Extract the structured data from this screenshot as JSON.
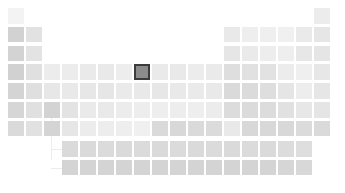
{
  "figure": {
    "title": "",
    "background": "#ffffff",
    "selected_color": "#8c8c8c",
    "selected_border": "#3c3c3c",
    "empty_color": "#ffffff"
  },
  "layout": {
    "cell_size": 15.5,
    "cell_pitch_x": 18.0,
    "cell_pitch_y": 18.8,
    "origin_x": 8,
    "origin_y": 8,
    "fblock_origin_x": 62,
    "fblock_origin_y": 141,
    "columns": 18,
    "main_rows": 7,
    "fblock_rows": 2,
    "fblock_columns": 14
  },
  "chart_data": {
    "type": "heatmap",
    "title": "",
    "xlabel": "",
    "ylabel": "",
    "grid": false,
    "legend": "none",
    "colorscale": "grayscale",
    "value_range": [
      0,
      1
    ],
    "selected": {
      "symbol": "Fe",
      "name": "Iron",
      "atomic_number": 26,
      "group": 8,
      "period": 4,
      "value": 0.48
    },
    "cells": [
      {
        "symbol": "H",
        "z": 1,
        "group": 1,
        "period": 1,
        "value": 0.06,
        "color": "#f3f3f3"
      },
      {
        "symbol": "He",
        "z": 2,
        "group": 18,
        "period": 1,
        "value": 0.13,
        "color": "#ececec"
      },
      {
        "symbol": "Li",
        "z": 3,
        "group": 1,
        "period": 2,
        "value": 0.32,
        "color": "#d2d2d2"
      },
      {
        "symbol": "Be",
        "z": 4,
        "group": 2,
        "period": 2,
        "value": 0.2,
        "color": "#e2e2e2"
      },
      {
        "symbol": "B",
        "z": 5,
        "group": 13,
        "period": 2,
        "value": 0.15,
        "color": "#e9e9e9"
      },
      {
        "symbol": "C",
        "z": 6,
        "group": 14,
        "period": 2,
        "value": 0.11,
        "color": "#eeeeee"
      },
      {
        "symbol": "N",
        "z": 7,
        "group": 15,
        "period": 2,
        "value": 0.1,
        "color": "#efefef"
      },
      {
        "symbol": "O",
        "z": 8,
        "group": 16,
        "period": 2,
        "value": 0.09,
        "color": "#f0f0f0"
      },
      {
        "symbol": "F",
        "z": 9,
        "group": 17,
        "period": 2,
        "value": 0.14,
        "color": "#eaeaea"
      },
      {
        "symbol": "Ne",
        "z": 10,
        "group": 18,
        "period": 2,
        "value": 0.17,
        "color": "#e6e6e6"
      },
      {
        "symbol": "Na",
        "z": 11,
        "group": 1,
        "period": 3,
        "value": 0.31,
        "color": "#d3d3d3"
      },
      {
        "symbol": "Mg",
        "z": 12,
        "group": 2,
        "period": 3,
        "value": 0.19,
        "color": "#e3e3e3"
      },
      {
        "symbol": "Al",
        "z": 13,
        "group": 13,
        "period": 3,
        "value": 0.17,
        "color": "#e6e6e6"
      },
      {
        "symbol": "Si",
        "z": 14,
        "group": 14,
        "period": 3,
        "value": 0.14,
        "color": "#eaeaea"
      },
      {
        "symbol": "P",
        "z": 15,
        "group": 15,
        "period": 3,
        "value": 0.12,
        "color": "#ededed"
      },
      {
        "symbol": "S",
        "z": 16,
        "group": 16,
        "period": 3,
        "value": 0.11,
        "color": "#eeeeee"
      },
      {
        "symbol": "Cl",
        "z": 17,
        "group": 17,
        "period": 3,
        "value": 0.16,
        "color": "#e7e7e7"
      },
      {
        "symbol": "Ar",
        "z": 18,
        "group": 18,
        "period": 3,
        "value": 0.18,
        "color": "#e5e5e5"
      },
      {
        "symbol": "K",
        "z": 19,
        "group": 1,
        "period": 4,
        "value": 0.33,
        "color": "#d1d1d1"
      },
      {
        "symbol": "Ca",
        "z": 20,
        "group": 2,
        "period": 4,
        "value": 0.22,
        "color": "#e0e0e0"
      },
      {
        "symbol": "Sc",
        "z": 21,
        "group": 3,
        "period": 4,
        "value": 0.13,
        "color": "#ececec"
      },
      {
        "symbol": "Ti",
        "z": 22,
        "group": 4,
        "period": 4,
        "value": 0.13,
        "color": "#ececec"
      },
      {
        "symbol": "V",
        "z": 23,
        "group": 5,
        "period": 4,
        "value": 0.14,
        "color": "#eaeaea"
      },
      {
        "symbol": "Cr",
        "z": 24,
        "group": 6,
        "period": 4,
        "value": 0.15,
        "color": "#e9e9e9"
      },
      {
        "symbol": "Mn",
        "z": 25,
        "group": 7,
        "period": 4,
        "value": 0.12,
        "color": "#ededed"
      },
      {
        "symbol": "Fe",
        "z": 26,
        "group": 8,
        "period": 4,
        "value": 0.48,
        "color": "#8c8c8c"
      },
      {
        "symbol": "Co",
        "z": 27,
        "group": 9,
        "period": 4,
        "value": 0.14,
        "color": "#eaeaea"
      },
      {
        "symbol": "Ni",
        "z": 28,
        "group": 10,
        "period": 4,
        "value": 0.15,
        "color": "#e9e9e9"
      },
      {
        "symbol": "Cu",
        "z": 29,
        "group": 11,
        "period": 4,
        "value": 0.13,
        "color": "#ececec"
      },
      {
        "symbol": "Zn",
        "z": 30,
        "group": 12,
        "period": 4,
        "value": 0.14,
        "color": "#eaeaea"
      },
      {
        "symbol": "Ga",
        "z": 31,
        "group": 13,
        "period": 4,
        "value": 0.24,
        "color": "#dedede"
      },
      {
        "symbol": "Ge",
        "z": 32,
        "group": 14,
        "period": 4,
        "value": 0.21,
        "color": "#e1e1e1"
      },
      {
        "symbol": "As",
        "z": 33,
        "group": 15,
        "period": 4,
        "value": 0.2,
        "color": "#e2e2e2"
      },
      {
        "symbol": "Se",
        "z": 34,
        "group": 16,
        "period": 4,
        "value": 0.13,
        "color": "#ececec"
      },
      {
        "symbol": "Br",
        "z": 35,
        "group": 17,
        "period": 4,
        "value": 0.1,
        "color": "#efefef"
      },
      {
        "symbol": "Kr",
        "z": 36,
        "group": 18,
        "period": 4,
        "value": 0.16,
        "color": "#e7e7e7"
      },
      {
        "symbol": "Rb",
        "z": 37,
        "group": 1,
        "period": 5,
        "value": 0.3,
        "color": "#d4d4d4"
      },
      {
        "symbol": "Sr",
        "z": 38,
        "group": 2,
        "period": 5,
        "value": 0.23,
        "color": "#dfdfdf"
      },
      {
        "symbol": "Y",
        "z": 39,
        "group": 3,
        "period": 5,
        "value": 0.16,
        "color": "#e7e7e7"
      },
      {
        "symbol": "Zr",
        "z": 40,
        "group": 4,
        "period": 5,
        "value": 0.15,
        "color": "#e9e9e9"
      },
      {
        "symbol": "Nb",
        "z": 41,
        "group": 5,
        "period": 5,
        "value": 0.16,
        "color": "#e7e7e7"
      },
      {
        "symbol": "Mo",
        "z": 42,
        "group": 6,
        "period": 5,
        "value": 0.17,
        "color": "#e6e6e6"
      },
      {
        "symbol": "Tc",
        "z": 43,
        "group": 7,
        "period": 5,
        "value": 0.14,
        "color": "#eaeaea"
      },
      {
        "symbol": "Ru",
        "z": 44,
        "group": 8,
        "period": 5,
        "value": 0.15,
        "color": "#e9e9e9"
      },
      {
        "symbol": "Rh",
        "z": 45,
        "group": 9,
        "period": 5,
        "value": 0.16,
        "color": "#e7e7e7"
      },
      {
        "symbol": "Pd",
        "z": 46,
        "group": 10,
        "period": 5,
        "value": 0.15,
        "color": "#e9e9e9"
      },
      {
        "symbol": "Ag",
        "z": 47,
        "group": 11,
        "period": 5,
        "value": 0.14,
        "color": "#eaeaea"
      },
      {
        "symbol": "Cd",
        "z": 48,
        "group": 12,
        "period": 5,
        "value": 0.15,
        "color": "#e9e9e9"
      },
      {
        "symbol": "In",
        "z": 49,
        "group": 13,
        "period": 5,
        "value": 0.27,
        "color": "#dadada"
      },
      {
        "symbol": "Sn",
        "z": 50,
        "group": 14,
        "period": 5,
        "value": 0.26,
        "color": "#dbdbdb"
      },
      {
        "symbol": "Sb",
        "z": 51,
        "group": 15,
        "period": 5,
        "value": 0.24,
        "color": "#dedede"
      },
      {
        "symbol": "Te",
        "z": 52,
        "group": 16,
        "period": 5,
        "value": 0.18,
        "color": "#e5e5e5"
      },
      {
        "symbol": "I",
        "z": 53,
        "group": 17,
        "period": 5,
        "value": 0.12,
        "color": "#ededed"
      },
      {
        "symbol": "Xe",
        "z": 54,
        "group": 18,
        "period": 5,
        "value": 0.17,
        "color": "#e6e6e6"
      },
      {
        "symbol": "Cs",
        "z": 55,
        "group": 1,
        "period": 6,
        "value": 0.29,
        "color": "#d6d6d6"
      },
      {
        "symbol": "Ba",
        "z": 56,
        "group": 2,
        "period": 6,
        "value": 0.22,
        "color": "#e0e0e0"
      },
      {
        "symbol": "La",
        "z": 57,
        "group": 3,
        "period": 6,
        "value": 0.31,
        "color": "#d3d3d3"
      },
      {
        "symbol": "Hf",
        "z": 72,
        "group": 4,
        "period": 6,
        "value": 0.19,
        "color": "#e3e3e3"
      },
      {
        "symbol": "Ta",
        "z": 73,
        "group": 5,
        "period": 6,
        "value": 0.14,
        "color": "#eaeaea"
      },
      {
        "symbol": "W",
        "z": 74,
        "group": 6,
        "period": 6,
        "value": 0.15,
        "color": "#e9e9e9"
      },
      {
        "symbol": "Re",
        "z": 75,
        "group": 7,
        "period": 6,
        "value": 0.13,
        "color": "#ececec"
      },
      {
        "symbol": "Os",
        "z": 76,
        "group": 8,
        "period": 6,
        "value": 0.12,
        "color": "#ededed"
      },
      {
        "symbol": "Ir",
        "z": 77,
        "group": 9,
        "period": 6,
        "value": 0.11,
        "color": "#eeeeee"
      },
      {
        "symbol": "Pt",
        "z": 78,
        "group": 10,
        "period": 6,
        "value": 0.12,
        "color": "#ededed"
      },
      {
        "symbol": "Au",
        "z": 79,
        "group": 11,
        "period": 6,
        "value": 0.11,
        "color": "#eeeeee"
      },
      {
        "symbol": "Hg",
        "z": 80,
        "group": 12,
        "period": 6,
        "value": 0.13,
        "color": "#ececec"
      },
      {
        "symbol": "Tl",
        "z": 81,
        "group": 13,
        "period": 6,
        "value": 0.25,
        "color": "#dcdcdc"
      },
      {
        "symbol": "Pb",
        "z": 82,
        "group": 14,
        "period": 6,
        "value": 0.26,
        "color": "#dbdbdb"
      },
      {
        "symbol": "Bi",
        "z": 83,
        "group": 15,
        "period": 6,
        "value": 0.25,
        "color": "#dcdcdc"
      },
      {
        "symbol": "Po",
        "z": 84,
        "group": 16,
        "period": 6,
        "value": 0.21,
        "color": "#e1e1e1"
      },
      {
        "symbol": "At",
        "z": 85,
        "group": 17,
        "period": 6,
        "value": 0.16,
        "color": "#e7e7e7"
      },
      {
        "symbol": "Rn",
        "z": 86,
        "group": 18,
        "period": 6,
        "value": 0.18,
        "color": "#e5e5e5"
      },
      {
        "symbol": "Fr",
        "z": 87,
        "group": 1,
        "period": 7,
        "value": 0.27,
        "color": "#dadada"
      },
      {
        "symbol": "Ra",
        "z": 88,
        "group": 2,
        "period": 7,
        "value": 0.21,
        "color": "#e1e1e1"
      },
      {
        "symbol": "Ac",
        "z": 89,
        "group": 3,
        "period": 7,
        "value": 0.3,
        "color": "#d4d4d4"
      },
      {
        "symbol": "Rf",
        "z": 104,
        "group": 4,
        "period": 7,
        "value": 0.17,
        "color": "#e6e6e6"
      },
      {
        "symbol": "Db",
        "z": 105,
        "group": 5,
        "period": 7,
        "value": 0.13,
        "color": "#ececec"
      },
      {
        "symbol": "Sg",
        "z": 106,
        "group": 6,
        "period": 7,
        "value": 0.12,
        "color": "#ededed"
      },
      {
        "symbol": "Bh",
        "z": 107,
        "group": 7,
        "period": 7,
        "value": 0.11,
        "color": "#eeeeee"
      },
      {
        "symbol": "Hs",
        "z": 108,
        "group": 8,
        "period": 7,
        "value": 0.09,
        "color": "#f0f0f0"
      },
      {
        "symbol": "Mt",
        "z": 109,
        "group": 9,
        "period": 7,
        "value": 0.27,
        "color": "#dadada"
      },
      {
        "symbol": "Ds",
        "z": 110,
        "group": 10,
        "period": 7,
        "value": 0.28,
        "color": "#d8d8d8"
      },
      {
        "symbol": "Rg",
        "z": 111,
        "group": 11,
        "period": 7,
        "value": 0.27,
        "color": "#dadada"
      },
      {
        "symbol": "Cn",
        "z": 112,
        "group": 12,
        "period": 7,
        "value": 0.26,
        "color": "#dbdbdb"
      },
      {
        "symbol": "Nh",
        "z": 113,
        "group": 13,
        "period": 7,
        "value": 0.15,
        "color": "#e9e9e9"
      },
      {
        "symbol": "Fl",
        "z": 114,
        "group": 14,
        "period": 7,
        "value": 0.28,
        "color": "#d8d8d8"
      },
      {
        "symbol": "Mc",
        "z": 115,
        "group": 15,
        "period": 7,
        "value": 0.28,
        "color": "#d8d8d8"
      },
      {
        "symbol": "Lv",
        "z": 116,
        "group": 16,
        "period": 7,
        "value": 0.28,
        "color": "#d8d8d8"
      },
      {
        "symbol": "Ts",
        "z": 117,
        "group": 17,
        "period": 7,
        "value": 0.26,
        "color": "#dbdbdb"
      },
      {
        "symbol": "Og",
        "z": 118,
        "group": 18,
        "period": 7,
        "value": 0.27,
        "color": "#dadada"
      }
    ],
    "fblock_cells": [
      {
        "symbol": "Ce",
        "z": 58,
        "col": 1,
        "row": 1,
        "value": 0.27,
        "color": "#dadada"
      },
      {
        "symbol": "Pr",
        "z": 59,
        "col": 2,
        "row": 1,
        "value": 0.27,
        "color": "#dadada"
      },
      {
        "symbol": "Nd",
        "z": 60,
        "col": 3,
        "row": 1,
        "value": 0.26,
        "color": "#dbdbdb"
      },
      {
        "symbol": "Pm",
        "z": 61,
        "col": 4,
        "row": 1,
        "value": 0.27,
        "color": "#dadada"
      },
      {
        "symbol": "Sm",
        "z": 62,
        "col": 5,
        "row": 1,
        "value": 0.26,
        "color": "#dbdbdb"
      },
      {
        "symbol": "Eu",
        "z": 63,
        "col": 6,
        "row": 1,
        "value": 0.27,
        "color": "#dadada"
      },
      {
        "symbol": "Gd",
        "z": 64,
        "col": 7,
        "row": 1,
        "value": 0.26,
        "color": "#dbdbdb"
      },
      {
        "symbol": "Tb",
        "z": 65,
        "col": 8,
        "row": 1,
        "value": 0.27,
        "color": "#dadada"
      },
      {
        "symbol": "Dy",
        "z": 66,
        "col": 9,
        "row": 1,
        "value": 0.26,
        "color": "#dbdbdb"
      },
      {
        "symbol": "Ho",
        "z": 67,
        "col": 10,
        "row": 1,
        "value": 0.27,
        "color": "#dadada"
      },
      {
        "symbol": "Er",
        "z": 68,
        "col": 11,
        "row": 1,
        "value": 0.26,
        "color": "#dbdbdb"
      },
      {
        "symbol": "Tm",
        "z": 69,
        "col": 12,
        "row": 1,
        "value": 0.27,
        "color": "#dadada"
      },
      {
        "symbol": "Yb",
        "z": 70,
        "col": 13,
        "row": 1,
        "value": 0.25,
        "color": "#dcdcdc"
      },
      {
        "symbol": "Lu",
        "z": 71,
        "col": 14,
        "row": 1,
        "value": 0.24,
        "color": "#dedede"
      },
      {
        "symbol": "Th",
        "z": 90,
        "col": 1,
        "row": 2,
        "value": 0.3,
        "color": "#d4d4d4"
      },
      {
        "symbol": "Pa",
        "z": 91,
        "col": 2,
        "row": 2,
        "value": 0.3,
        "color": "#d4d4d4"
      },
      {
        "symbol": "U",
        "z": 92,
        "col": 3,
        "row": 2,
        "value": 0.3,
        "color": "#d4d4d4"
      },
      {
        "symbol": "Np",
        "z": 93,
        "col": 4,
        "row": 2,
        "value": 0.3,
        "color": "#d4d4d4"
      },
      {
        "symbol": "Pu",
        "z": 94,
        "col": 5,
        "row": 2,
        "value": 0.3,
        "color": "#d4d4d4"
      },
      {
        "symbol": "Am",
        "z": 95,
        "col": 6,
        "row": 2,
        "value": 0.3,
        "color": "#d4d4d4"
      },
      {
        "symbol": "Cm",
        "z": 96,
        "col": 7,
        "row": 2,
        "value": 0.3,
        "color": "#d4d4d4"
      },
      {
        "symbol": "Bk",
        "z": 97,
        "col": 8,
        "row": 2,
        "value": 0.3,
        "color": "#d4d4d4"
      },
      {
        "symbol": "Cf",
        "z": 98,
        "col": 9,
        "row": 2,
        "value": 0.3,
        "color": "#d4d4d4"
      },
      {
        "symbol": "Es",
        "z": 99,
        "col": 10,
        "row": 2,
        "value": 0.3,
        "color": "#d4d4d4"
      },
      {
        "symbol": "Fm",
        "z": 100,
        "col": 11,
        "row": 2,
        "value": 0.3,
        "color": "#d4d4d4"
      },
      {
        "symbol": "Md",
        "z": 101,
        "col": 12,
        "row": 2,
        "value": 0.3,
        "color": "#d4d4d4"
      },
      {
        "symbol": "No",
        "z": 102,
        "col": 13,
        "row": 2,
        "value": 0.29,
        "color": "#d6d6d6"
      },
      {
        "symbol": "Lr",
        "z": 103,
        "col": 14,
        "row": 2,
        "value": 0.28,
        "color": "#d8d8d8"
      }
    ],
    "connector": {
      "visible": true,
      "color": "#ececec"
    }
  }
}
